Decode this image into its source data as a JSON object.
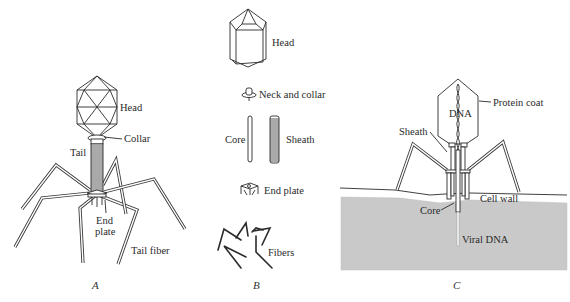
{
  "figure": {
    "panels": [
      {
        "id": "A",
        "caption": "A",
        "labels": {
          "head": "Head",
          "collar": "Collar",
          "tail": "Tail",
          "end_plate_line1": "End",
          "end_plate_line2": "plate",
          "tail_fiber": "Tail fiber"
        }
      },
      {
        "id": "B",
        "caption": "B",
        "labels": {
          "head": "Head",
          "neck_and_collar": "Neck and collar",
          "core": "Core",
          "sheath": "Sheath",
          "end_plate": "End plate",
          "fibers": "Fibers"
        }
      },
      {
        "id": "C",
        "caption": "C",
        "labels": {
          "protein_coat": "Protein coat",
          "dna": "DNA",
          "sheath": "Sheath",
          "cell_wall": "Cell wall",
          "core": "Core",
          "viral_dna": "Viral DNA"
        }
      }
    ],
    "colors": {
      "line": "#2a2a2a",
      "cell_interior": "#c9c9c9",
      "background": "#ffffff"
    }
  }
}
